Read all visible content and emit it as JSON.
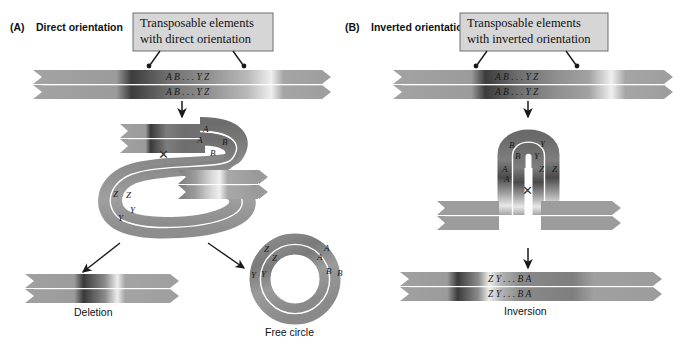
{
  "figure": {
    "background": "#ffffff",
    "strand_gray": "#9a9a9a",
    "strand_dark": "#3a3a3a",
    "strand_light": "#ececec",
    "callout_fill": "#d6d6d6",
    "callout_border": "#6f6f6f",
    "line_color": "#1a1a1a"
  },
  "panels": [
    {
      "id": "A",
      "tag": "(A)",
      "title": "Direct orientation",
      "callout": {
        "line1": "Transposable elements",
        "line2": "with direct orientation"
      },
      "top_strand": {
        "upper_seq": "A B . . . Y Z",
        "lower_seq": "A B . . . Y Z"
      },
      "loop_labels": [
        "A",
        "A",
        "B",
        "B",
        "Z",
        "Z",
        "Y",
        "Y"
      ],
      "crossover_mark": "✕",
      "outcomes": [
        {
          "name": "deletion",
          "label": "Deletion"
        },
        {
          "name": "free-circle",
          "label": "Free circle",
          "circle_labels": [
            "Z",
            "Z",
            "A",
            "A",
            "Y",
            "Y",
            "B",
            "B"
          ]
        }
      ]
    },
    {
      "id": "B",
      "tag": "(B)",
      "title": "Inverted orientation",
      "callout": {
        "line1": "Transposable elements",
        "line2": "with inverted orientation"
      },
      "top_strand": {
        "upper_seq": "A B . . . Y Z",
        "lower_seq": "A B . . . Y Z"
      },
      "hairpin_labels": [
        "B",
        "B",
        "Y",
        "Y",
        "A",
        "A",
        "Z",
        "Z"
      ],
      "crossover_mark": "✕",
      "outcomes": [
        {
          "name": "inversion",
          "label": "Inversion",
          "upper_seq": "Z Y . . . B A",
          "lower_seq": "Z Y . . . B A"
        }
      ]
    }
  ]
}
